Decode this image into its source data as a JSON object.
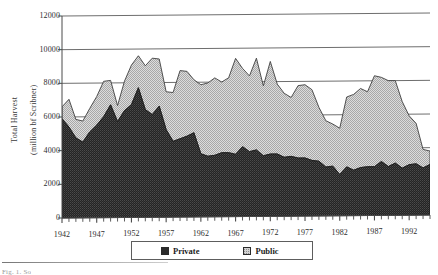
{
  "figure": {
    "caption": "Fig. 1. So"
  },
  "chart_data": {
    "type": "area",
    "stacked": true,
    "title": "",
    "xlabel": "",
    "ylabel": "Total Harvest\n(million bf Scribner)",
    "ylabel_lines": [
      "Total Harvest",
      "(million bf Scribner)"
    ],
    "ylim": [
      0,
      12000
    ],
    "yticks": [
      0,
      2000,
      4000,
      6000,
      8000,
      10000,
      12000
    ],
    "ytick_labels": [
      "0",
      "2000",
      "4000",
      "6000",
      "8000",
      "10000",
      "12000"
    ],
    "xlim": [
      1942,
      1995
    ],
    "xticks": [
      1942,
      1947,
      1952,
      1957,
      1962,
      1967,
      1972,
      1977,
      1982,
      1987,
      1992
    ],
    "xtick_labels": [
      "1942",
      "1947",
      "1952",
      "1957",
      "1962",
      "1967",
      "1972",
      "1977",
      "1982",
      "1987",
      "1992"
    ],
    "minor_tick_interval": 1,
    "grid": true,
    "grid_axis": "y",
    "legend_position": "bottom",
    "colors": {
      "private": "#2b2b2b",
      "public": "#d4d4d4",
      "grid": "#6e6e6e",
      "axis": "#4a4a4a"
    },
    "x": [
      1942,
      1943,
      1944,
      1945,
      1946,
      1947,
      1948,
      1949,
      1950,
      1951,
      1952,
      1953,
      1954,
      1955,
      1956,
      1957,
      1958,
      1959,
      1960,
      1961,
      1962,
      1963,
      1964,
      1965,
      1966,
      1967,
      1968,
      1969,
      1970,
      1971,
      1972,
      1973,
      1974,
      1975,
      1976,
      1977,
      1978,
      1979,
      1980,
      1981,
      1982,
      1983,
      1984,
      1985,
      1986,
      1987,
      1988,
      1989,
      1990,
      1991,
      1992,
      1993,
      1994,
      1995
    ],
    "series": [
      {
        "name": "Private",
        "values": [
          5900,
          5400,
          4750,
          4500,
          5100,
          5500,
          6000,
          6700,
          5700,
          6350,
          6700,
          7700,
          6400,
          6100,
          6600,
          5200,
          4500,
          4650,
          4800,
          5000,
          3750,
          3600,
          3650,
          3800,
          3800,
          3700,
          4150,
          3850,
          3950,
          3600,
          3700,
          3700,
          3500,
          3550,
          3450,
          3450,
          3300,
          3250,
          2900,
          2950,
          2450,
          2900,
          2700,
          2850,
          2900,
          2900,
          3200,
          2900,
          3100,
          2800,
          3000,
          3050,
          2800,
          3000
        ]
      },
      {
        "name": "Public",
        "values": [
          700,
          1650,
          1100,
          1250,
          1400,
          1700,
          2100,
          1450,
          950,
          1750,
          2350,
          1900,
          2600,
          3350,
          2800,
          2250,
          2900,
          4050,
          3850,
          3150,
          4100,
          4350,
          4600,
          4200,
          4450,
          5700,
          4650,
          4500,
          5450,
          4150,
          5500,
          4150,
          3800,
          3500,
          4300,
          4350,
          4200,
          3200,
          2750,
          2500,
          2750,
          4150,
          4500,
          4700,
          4450,
          5400,
          5000,
          5100,
          4900,
          3950,
          2900,
          2400,
          1100,
          800
        ]
      }
    ]
  }
}
